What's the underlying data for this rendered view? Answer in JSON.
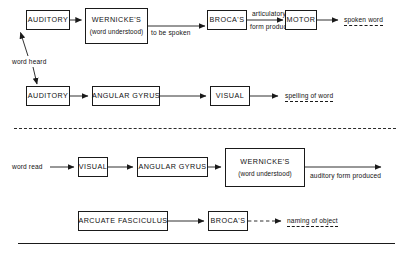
{
  "diagram": {
    "line_color": "#1a1a1a",
    "text_color": "#111111",
    "background": "#ffffff",
    "rows": [
      {
        "id": "row-speaking-heard-word",
        "nodes": [
          {
            "id": "auditory-1",
            "line1": "AUDITORY",
            "line2": ""
          },
          {
            "id": "wernickes-1",
            "line1": "WERNICKE'S",
            "line2": "(word understood)"
          },
          {
            "id": "brocas-1",
            "line1": "BROCA'S",
            "line2": ""
          },
          {
            "id": "motor-1",
            "line1": "MOTOR",
            "line2": ""
          }
        ],
        "edge_labels": [
          {
            "id": "to-be-spoken",
            "text": "to be spoken"
          },
          {
            "id": "articulatory-form-produced-l1",
            "text": "articulatory"
          },
          {
            "id": "articulatory-form-produced-l2",
            "text": "form produced"
          }
        ],
        "output": {
          "id": "spoken-word",
          "text": "spoken word"
        }
      },
      {
        "id": "row-spelling",
        "nodes": [
          {
            "id": "auditory-2",
            "line1": "AUDITORY",
            "line2": ""
          },
          {
            "id": "angular-gyrus-1",
            "line1": "ANGULAR  GYRUS",
            "line2": ""
          },
          {
            "id": "visual-1",
            "line1": "VISUAL",
            "line2": ""
          }
        ],
        "output": {
          "id": "spelling-of-word",
          "text": "spelling of word"
        }
      },
      {
        "id": "row-reading",
        "input": {
          "id": "word-read",
          "text": "word read"
        },
        "nodes": [
          {
            "id": "visual-2",
            "line1": "VISUAL",
            "line2": ""
          },
          {
            "id": "angular-gyrus-2",
            "line1": "ANGULAR  GYRUS",
            "line2": ""
          },
          {
            "id": "wernickes-2",
            "line1": "WERNICKE'S",
            "line2": "(word understood)"
          }
        ],
        "output": {
          "id": "auditory-form-produced",
          "text": "auditory form produced"
        }
      },
      {
        "id": "row-naming",
        "nodes": [
          {
            "id": "arcuate-fasciculus",
            "line1": "ARCUATE  FASCICULUS",
            "line2": ""
          },
          {
            "id": "brocas-2",
            "line1": "BROCA'S",
            "line2": ""
          }
        ],
        "output": {
          "id": "naming-of-object",
          "text": "naming of object"
        }
      }
    ],
    "shared_input": {
      "id": "word-heard",
      "text": "word heard"
    }
  }
}
